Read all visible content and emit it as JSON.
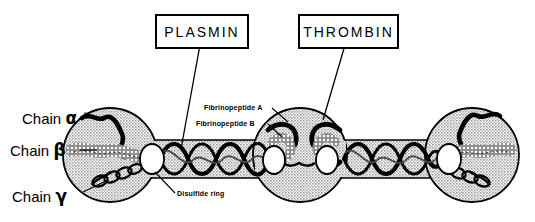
{
  "figure": {
    "colors": {
      "outline": "#000000",
      "nodule_fill": "#c9c9c9",
      "rod_fill": "#c9c9c9",
      "background": "#ffffff",
      "disulfide_ring_fill": "#ffffff"
    }
  },
  "callouts": [
    {
      "id": "plasmin",
      "label": "PLASMIN",
      "target": "coiled-coil-rod-left"
    },
    {
      "id": "thrombin",
      "label": "THROMBIN",
      "target": "central-nodule-fibrinopeptides"
    }
  ],
  "chain_labels": [
    {
      "id": "alpha",
      "text": "Chain",
      "symbol": "α"
    },
    {
      "id": "beta",
      "text": "Chain",
      "symbol": "β"
    },
    {
      "id": "gamma",
      "text": "Chain",
      "symbol": "γ"
    }
  ],
  "annotations": [
    {
      "id": "fibrinopeptide-a",
      "label": "Fibrinopeptide A"
    },
    {
      "id": "fibrinopeptide-b",
      "label": "Fibrinopeptide B"
    },
    {
      "id": "disulfide-ring",
      "label": "Disulfide ring"
    }
  ],
  "structure": {
    "nodules": [
      {
        "id": "left-nodule",
        "cx": 110,
        "cy": 155,
        "r": 47
      },
      {
        "id": "central-nodule",
        "cx": 300,
        "cy": 155,
        "r": 47
      },
      {
        "id": "right-nodule",
        "cx": 472,
        "cy": 155,
        "r": 47
      }
    ],
    "rods": [
      {
        "id": "rod-left",
        "x1": 150,
        "x2": 262,
        "cy": 158,
        "half_height": 18
      },
      {
        "id": "rod-right",
        "x1": 338,
        "x2": 438,
        "cy": 158,
        "half_height": 18
      }
    ],
    "disulfide_rings": [
      {
        "id": "ring-1",
        "cx": 155,
        "cy": 159
      },
      {
        "id": "ring-2",
        "cx": 277,
        "cy": 160
      },
      {
        "id": "ring-3",
        "cx": 332,
        "cy": 160
      },
      {
        "id": "ring-4",
        "cx": 455,
        "cy": 160
      }
    ]
  }
}
